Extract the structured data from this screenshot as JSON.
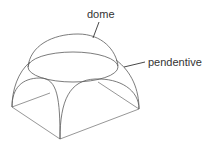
{
  "diagram": {
    "labels": {
      "dome": "dome",
      "pendentive": "pendentive"
    },
    "colors": {
      "line": "#5a5a5a",
      "text": "#333333",
      "background": "#ffffff"
    }
  }
}
